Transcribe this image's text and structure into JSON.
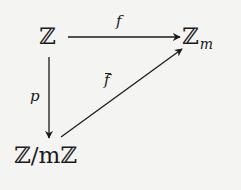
{
  "diagram": {
    "type": "commutative-diagram",
    "nodes": {
      "source": {
        "base": "ℤ",
        "subscript": ""
      },
      "target": {
        "base": "ℤ",
        "subscript": "m"
      },
      "quotient": {
        "base": "ℤ/mℤ",
        "subscript": ""
      }
    },
    "arrows": {
      "top": {
        "label": "f",
        "from": "ℤ",
        "to": "ℤ_m"
      },
      "left": {
        "label": "p",
        "from": "ℤ",
        "to": "ℤ/mℤ"
      },
      "diagonal": {
        "label": "f",
        "label_decoration": "bar",
        "from": "ℤ/mℤ",
        "to": "ℤ_m"
      }
    },
    "colors": {
      "background": "#f4f4f2",
      "ink": "#1a1a1a"
    }
  }
}
